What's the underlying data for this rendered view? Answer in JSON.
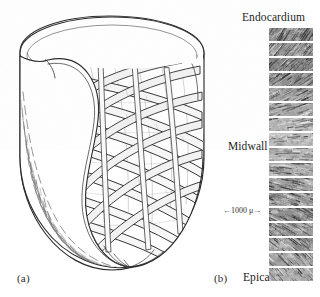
{
  "figure": {
    "caption_a": "(a)",
    "caption_b": "(b)",
    "panel_a": {
      "name": "ventricular-myocardium-fiber-architecture-drawing",
      "description": "Cutaway line drawing of the cardiac ventricle showing helically wound muscle fiber bands"
    },
    "panel_b": {
      "name": "transmural-histology-strip-series",
      "labels": {
        "top": "Endocardium",
        "middle": "Midwall",
        "bottom": "Epicardium"
      },
      "scale_bar": "←1000 μ→",
      "strip_count": 17,
      "strips": [
        {
          "index": 1,
          "angle": -58,
          "density": 0.86,
          "height": 13,
          "tone": "#8e8e8e"
        },
        {
          "index": 2,
          "angle": -50,
          "density": 0.8,
          "height": 13,
          "tone": "#9a9a9a"
        },
        {
          "index": 3,
          "angle": -42,
          "density": 0.9,
          "height": 13,
          "tone": "#848484"
        },
        {
          "index": 4,
          "angle": -34,
          "density": 0.82,
          "height": 13,
          "tone": "#909090"
        },
        {
          "index": 5,
          "angle": -26,
          "density": 0.74,
          "height": 13,
          "tone": "#9e9e9e"
        },
        {
          "index": 6,
          "angle": -18,
          "density": 0.62,
          "height": 13,
          "tone": "#aaaaaa"
        },
        {
          "index": 7,
          "angle": -10,
          "density": 0.5,
          "height": 13,
          "tone": "#b4b4b4"
        },
        {
          "index": 8,
          "angle": -4,
          "density": 0.42,
          "height": 13,
          "tone": "#bcbcbc"
        },
        {
          "index": 9,
          "angle": 2,
          "density": 0.46,
          "height": 13,
          "tone": "#b6b6b6"
        },
        {
          "index": 10,
          "angle": 8,
          "density": 0.56,
          "height": 13,
          "tone": "#ababab"
        },
        {
          "index": 11,
          "angle": 14,
          "density": 0.64,
          "height": 13,
          "tone": "#a2a2a2"
        },
        {
          "index": 12,
          "angle": 20,
          "density": 0.72,
          "height": 13,
          "tone": "#999999"
        },
        {
          "index": 13,
          "angle": 26,
          "density": 0.8,
          "height": 13,
          "tone": "#909090"
        },
        {
          "index": 14,
          "angle": 32,
          "density": 0.76,
          "height": 13,
          "tone": "#969696"
        },
        {
          "index": 15,
          "angle": 38,
          "density": 0.7,
          "height": 13,
          "tone": "#9d9d9d"
        },
        {
          "index": 16,
          "angle": 44,
          "density": 0.66,
          "height": 13,
          "tone": "#a3a3a3"
        },
        {
          "index": 17,
          "angle": 50,
          "density": 0.54,
          "height": 13,
          "tone": "#afafaf"
        }
      ]
    },
    "colors": {
      "ink": "#2b2b2b",
      "paper": "#ffffff",
      "cut_wall_fill": "#cdcdcd",
      "band_fill": "#f4f4f4"
    }
  }
}
